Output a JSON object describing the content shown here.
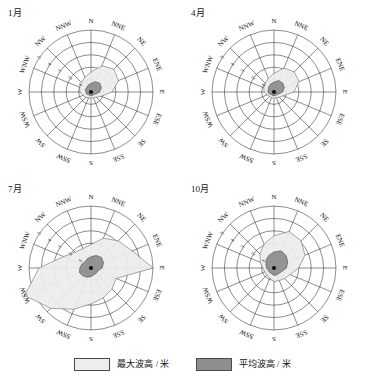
{
  "figure": {
    "panels": [
      {
        "id": "panel-jan",
        "title": "1月",
        "max_values": [
          1.6,
          2.3,
          2.6,
          2.4,
          1.7,
          0.9,
          0.6,
          0.5,
          0.5,
          0.5,
          0.6,
          0.7,
          0.9,
          1.0,
          1.1,
          1.3
        ],
        "mean_values": [
          0.7,
          0.9,
          1.0,
          0.9,
          0.7,
          0.4,
          0.3,
          0.3,
          0.3,
          0.3,
          0.3,
          0.4,
          0.4,
          0.5,
          0.5,
          0.6
        ]
      },
      {
        "id": "panel-apr",
        "title": "4月",
        "max_values": [
          1.5,
          2.1,
          2.3,
          2.2,
          1.6,
          0.8,
          0.6,
          0.5,
          0.5,
          0.5,
          0.5,
          0.6,
          0.8,
          0.9,
          1.0,
          1.2
        ],
        "mean_values": [
          0.8,
          1.0,
          1.0,
          0.9,
          0.7,
          0.4,
          0.3,
          0.3,
          0.3,
          0.3,
          0.3,
          0.4,
          0.5,
          0.5,
          0.6,
          0.7
        ]
      },
      {
        "id": "panel-jul",
        "title": "7月",
        "max_values": [
          1.9,
          2.6,
          3.1,
          3.6,
          5.0,
          2.2,
          2.4,
          2.6,
          2.9,
          3.6,
          4.6,
          5.8,
          4.2,
          2.4,
          1.8,
          1.7
        ],
        "mean_values": [
          0.9,
          1.1,
          1.2,
          1.1,
          0.9,
          0.6,
          0.6,
          0.6,
          0.7,
          0.8,
          0.9,
          1.0,
          0.9,
          0.8,
          0.7,
          0.8
        ]
      },
      {
        "id": "panel-oct",
        "title": "10月",
        "max_values": [
          2.6,
          3.2,
          3.1,
          2.7,
          2.0,
          1.4,
          1.2,
          1.1,
          1.1,
          0.9,
          0.8,
          0.8,
          0.9,
          1.2,
          1.6,
          2.1
        ],
        "mean_values": [
          1.3,
          1.5,
          1.4,
          1.2,
          1.0,
          0.7,
          0.6,
          0.6,
          0.6,
          0.5,
          0.5,
          0.5,
          0.6,
          0.7,
          0.9,
          1.1
        ]
      }
    ],
    "directions": [
      "N",
      "NNE",
      "NE",
      "ENE",
      "E",
      "ESE",
      "SE",
      "SSE",
      "S",
      "SSW",
      "SW",
      "WSW",
      "W",
      "WNW",
      "NW",
      "NNW"
    ],
    "radial_ticks": [
      1,
      2,
      3,
      4,
      5
    ],
    "radial_max": 5,
    "legend": [
      {
        "label": "最大波高 / 米",
        "color": "#ededed"
      },
      {
        "label": "平均波高 / 米",
        "color": "#8e8e8e"
      }
    ]
  },
  "chart_data": {
    "type": "line",
    "subtitle": "",
    "xlabel": "方向",
    "ylabel": "波高 / 米",
    "ylim": [
      0,
      5
    ],
    "grid": true,
    "legend_position": "bottom",
    "categories": [
      "N",
      "NNE",
      "NE",
      "ENE",
      "E",
      "ESE",
      "SE",
      "SSE",
      "S",
      "SSW",
      "SW",
      "WSW",
      "W",
      "WNW",
      "NW",
      "NNW"
    ],
    "panels": [
      {
        "title": "1月",
        "series": [
          {
            "name": "最大波高 / 米",
            "values": [
              1.6,
              2.3,
              2.6,
              2.4,
              1.7,
              0.9,
              0.6,
              0.5,
              0.5,
              0.5,
              0.6,
              0.7,
              0.9,
              1.0,
              1.1,
              1.3
            ]
          },
          {
            "name": "平均波高 / 米",
            "values": [
              0.7,
              0.9,
              1.0,
              0.9,
              0.7,
              0.4,
              0.3,
              0.3,
              0.3,
              0.3,
              0.3,
              0.4,
              0.4,
              0.5,
              0.5,
              0.6
            ]
          }
        ]
      },
      {
        "title": "4月",
        "series": [
          {
            "name": "最大波高 / 米",
            "values": [
              1.5,
              2.1,
              2.3,
              2.2,
              1.6,
              0.8,
              0.6,
              0.5,
              0.5,
              0.5,
              0.5,
              0.6,
              0.8,
              0.9,
              1.0,
              1.2
            ]
          },
          {
            "name": "平均波高 / 米",
            "values": [
              0.8,
              1.0,
              1.0,
              0.9,
              0.7,
              0.4,
              0.3,
              0.3,
              0.3,
              0.3,
              0.3,
              0.4,
              0.5,
              0.5,
              0.6,
              0.7
            ]
          }
        ]
      },
      {
        "title": "7月",
        "series": [
          {
            "name": "最大波高 / 米",
            "values": [
              1.9,
              2.6,
              3.1,
              3.6,
              5.0,
              2.2,
              2.4,
              2.6,
              2.9,
              3.6,
              4.6,
              5.8,
              4.2,
              2.4,
              1.8,
              1.7
            ]
          },
          {
            "name": "平均波高 / 米",
            "values": [
              0.9,
              1.1,
              1.2,
              1.1,
              0.9,
              0.6,
              0.6,
              0.6,
              0.7,
              0.8,
              0.9,
              1.0,
              0.9,
              0.8,
              0.7,
              0.8
            ]
          }
        ]
      },
      {
        "title": "10月",
        "series": [
          {
            "name": "最大波高 / 米",
            "values": [
              2.6,
              3.2,
              3.1,
              2.7,
              2.0,
              1.4,
              1.2,
              1.1,
              1.1,
              0.9,
              0.8,
              0.8,
              0.9,
              1.2,
              1.6,
              2.1
            ]
          },
          {
            "name": "平均波高 / 米",
            "values": [
              1.3,
              1.5,
              1.4,
              1.2,
              1.0,
              0.7,
              0.6,
              0.6,
              0.6,
              0.5,
              0.5,
              0.5,
              0.6,
              0.7,
              0.9,
              1.1
            ]
          }
        ]
      }
    ]
  }
}
